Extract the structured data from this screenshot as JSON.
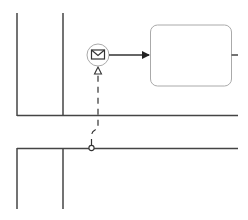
{
  "diagram": {
    "type": "bpmn-collaboration",
    "colors": {
      "background": "#ffffff",
      "line": "#333333",
      "task_border": "#999999",
      "event_border": "#999999"
    },
    "pools": [
      {
        "id": "pool-top",
        "label": ""
      },
      {
        "id": "pool-bottom",
        "label": ""
      }
    ],
    "elements": {
      "message_event": {
        "kind": "intermediate-catch-message-event",
        "icon": "envelope-icon"
      },
      "task": {
        "kind": "task",
        "label": ""
      },
      "sequence_flow": {
        "from": "message_event",
        "to": "task"
      },
      "message_flow": {
        "from": "pool-bottom",
        "to": "message_event",
        "style": "dashed"
      }
    }
  }
}
